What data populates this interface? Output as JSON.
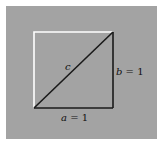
{
  "diagram": {
    "labels": {
      "hypotenuse": "c",
      "vertical_side_var": "b",
      "vertical_side_val": " = 1",
      "horizontal_side_var": "a",
      "horizontal_side_val": " = 1"
    },
    "colors": {
      "background": "#ffffff",
      "panel": "#a3a3a3",
      "square_outline_light": "#ffffff",
      "triangle_stroke": "#1a1a1a"
    }
  }
}
